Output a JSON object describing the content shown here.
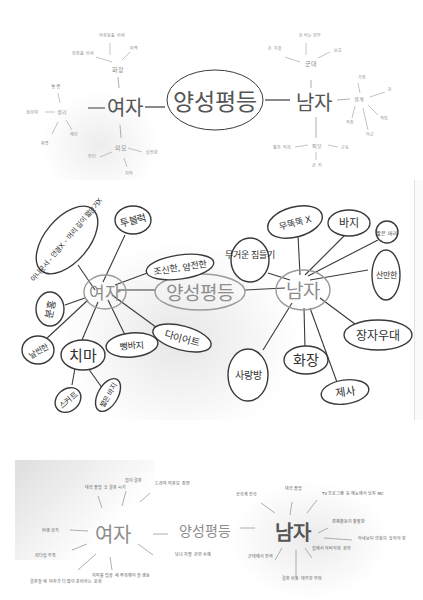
{
  "map1": {
    "center": "양성평등",
    "women": {
      "label": "여자",
      "sub_top": "화장",
      "sub_top_leaves": [
        "화장품 비싸",
        "여성용품 비싸",
        "미백"
      ],
      "sub_left": "생리",
      "sub_left_leaves": [
        "통증",
        "생리대",
        "예민",
        "짜증"
      ],
      "sub_bottom": "외모",
      "sub_bottom_leaves": [
        "뷰티",
        "날씬함",
        "치마"
      ]
    },
    "men": {
      "label": "남자",
      "sub_top": "군대",
      "sub_top_leaves": [
        "돈 지출",
        "돈 버는 의무",
        "보호"
      ],
      "sub_right": "생계",
      "sub_right_leaves": [
        "가장",
        "돈",
        "책임",
        "직장",
        "야근"
      ],
      "sub_bottom": "외모",
      "sub_bottom_leaves": [
        "짧은 머리",
        "근육",
        "큰 키"
      ]
    }
  },
  "map2": {
    "center": "양성평등",
    "women": {
      "label": "여자",
      "branches": [
        "아나운서 - 안경X - 머리 길이 짧은거X",
        "투블럭",
        "조신한, 얌전한",
        "다이어트",
        "뻥바지",
        "치마",
        "날씬한",
        "분홍",
        "스커트",
        "짧은 바지"
      ]
    },
    "men": {
      "label": "남자",
      "branches": [
        "무거운 짐들기",
        "무뚝뚝 X",
        "바지",
        "짧은 머리",
        "산만한",
        "장자우대",
        "제사",
        "화장",
        "사랑방"
      ]
    }
  },
  "map3": {
    "center": "양성평등",
    "women": {
      "label": "여자",
      "notes": [
        "대학 졸업 후 결혼 시기",
        "집이 결혼",
        "드라마 미혼모 장면",
        "남녀 차별 관련 사례",
        "여행 금지",
        "리더십 부족",
        "결혼할 때 여자가 더 많이 준비하는 문화",
        "치마를 입을 때 주의해야 할 행동"
      ]
    },
    "men": {
      "label": "남자",
      "notes": [
        "공학계 진학",
        "대학 졸업",
        "TV 프로그램 등 예능에서 남자 MC",
        "경제활동이 활발함",
        "아내보다 연봉이 높아야 함",
        "집에서 아버지의 권위",
        "군대에서 전역",
        "결혼 비용 대부분 부담"
      ]
    }
  }
}
